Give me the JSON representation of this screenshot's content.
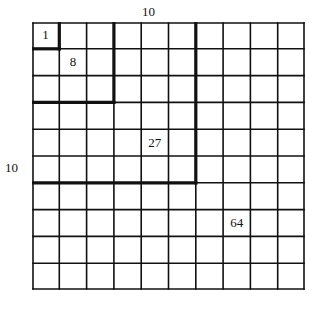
{
  "diagram": {
    "grid_size": 10,
    "top_label": "10",
    "side_label": "10",
    "line_color": "#111111",
    "background": "#ffffff",
    "nested_squares": [
      {
        "size": 1,
        "label": "1",
        "label_cell": [
          0,
          0
        ]
      },
      {
        "size": 3,
        "label": "8",
        "label_cell": [
          1,
          1
        ]
      },
      {
        "size": 6,
        "label": "27",
        "label_cell": [
          4,
          4
        ]
      },
      {
        "size": 10,
        "label": "64",
        "label_cell": [
          7,
          7
        ]
      }
    ]
  }
}
